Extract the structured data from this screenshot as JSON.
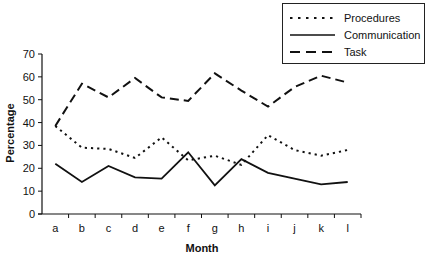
{
  "chart_data": {
    "type": "line",
    "title": "",
    "xlabel": "Month",
    "ylabel": "Percentage",
    "ylim": [
      0,
      70
    ],
    "yticks": [
      0,
      10,
      20,
      30,
      40,
      50,
      60,
      70
    ],
    "grid": false,
    "legend_position": "top-right",
    "categories": [
      "a",
      "b",
      "c",
      "d",
      "e",
      "f",
      "g",
      "h",
      "i",
      "j",
      "k",
      "l"
    ],
    "series": [
      {
        "name": "Procedures",
        "style": "dotted",
        "values": [
          38.5,
          29,
          28.5,
          24.5,
          33.5,
          23.5,
          25.5,
          21.5,
          34.5,
          28,
          25.5,
          28
        ]
      },
      {
        "name": "Communication",
        "style": "solid",
        "values": [
          22,
          14,
          21,
          16,
          15.5,
          27,
          12.5,
          24,
          18,
          15.5,
          13,
          14
        ]
      },
      {
        "name": "Task",
        "style": "dashed",
        "values": [
          38.5,
          57,
          51,
          59.5,
          51,
          49.5,
          61.5,
          54,
          47,
          55.5,
          60.5,
          57.5
        ]
      }
    ]
  },
  "colors": {
    "line": "#111111",
    "background": "#ffffff"
  }
}
